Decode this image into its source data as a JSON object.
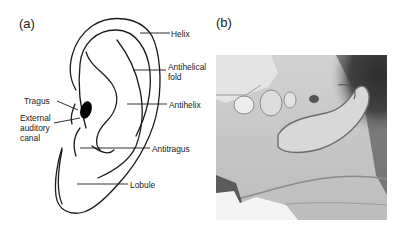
{
  "figure": {
    "panels": [
      {
        "id": "a",
        "label": "(a)",
        "type": "line-drawing",
        "subject": "ear-anatomy-diagram",
        "annotations": {
          "helix": "Helix",
          "antihelical_fold": "Antihelical fold",
          "antihelix": "Antihelix",
          "tragus": "Tragus",
          "external_auditory_canal": "External auditory canal",
          "antitragus": "Antitragus",
          "lobule": "Lobule"
        }
      },
      {
        "id": "b",
        "label": "(b)",
        "type": "grayscale-photograph",
        "subject": "infant-ear-photo"
      }
    ],
    "colors": {
      "background": "#ffffff",
      "line": "#1a1a1a",
      "canal_fill": "#000000",
      "photo_skin": "#c9c9c9",
      "photo_hair": "#2b2b2b"
    }
  }
}
